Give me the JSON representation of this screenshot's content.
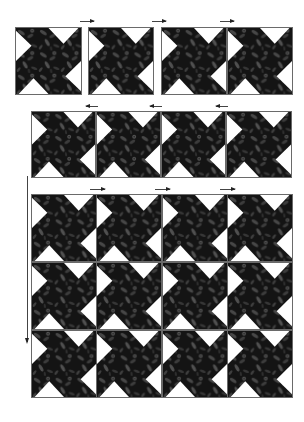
{
  "caption": "Rows of Pinwheel Star blocks assembly",
  "colors": {
    "background": "#ffffff",
    "fabric_dark": "#141414",
    "fabric_mid": "#3a3a3a",
    "fabric_light": "#5e5e5e",
    "triangle": "#ffffff",
    "outline": "#6a6a6a",
    "arrow": "#333333"
  },
  "stages": [
    {
      "name": "stage-1-join-pairs",
      "rows": 1,
      "blocks": [
        {
          "x": 15,
          "y": 27,
          "w": 67,
          "h": 68
        },
        {
          "x": 88,
          "y": 27,
          "w": 66,
          "h": 68
        },
        {
          "x": 161,
          "y": 27,
          "w": 66,
          "h": 68
        },
        {
          "x": 227,
          "y": 27,
          "w": 66,
          "h": 68
        }
      ],
      "arrows": [
        {
          "dir": "right",
          "x": 80,
          "y": 21,
          "len": 14
        },
        {
          "dir": "right",
          "x": 152,
          "y": 21,
          "len": 14
        },
        {
          "dir": "right",
          "x": 220,
          "y": 21,
          "len": 14
        },
        {
          "dir": "left",
          "x": 86,
          "y": 106,
          "len": 12
        },
        {
          "dir": "left",
          "x": 150,
          "y": 106,
          "len": 12
        },
        {
          "dir": "left",
          "x": 216,
          "y": 106,
          "len": 12
        }
      ]
    },
    {
      "name": "stage-2-row",
      "rows": 1,
      "blocks": [
        {
          "x": 31,
          "y": 111,
          "w": 65,
          "h": 67
        },
        {
          "x": 96,
          "y": 111,
          "w": 65,
          "h": 67
        },
        {
          "x": 161,
          "y": 111,
          "w": 65,
          "h": 67
        },
        {
          "x": 226,
          "y": 111,
          "w": 66,
          "h": 67
        }
      ],
      "arrows": [
        {
          "dir": "right",
          "x": 90,
          "y": 189,
          "len": 15
        },
        {
          "dir": "right",
          "x": 155,
          "y": 189,
          "len": 15
        },
        {
          "dir": "right",
          "x": 220,
          "y": 189,
          "len": 15
        }
      ]
    },
    {
      "name": "stage-3-quilt-top",
      "rows": 3,
      "cols": 4,
      "origin": {
        "x": 31,
        "y": 194
      },
      "block_w": 65.25,
      "block_h": 68,
      "vertical_arrow": {
        "x": 27,
        "y": 176,
        "len": 166
      }
    }
  ]
}
